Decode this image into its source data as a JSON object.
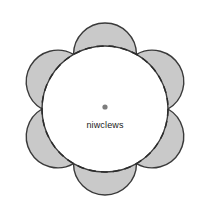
{
  "figure": {
    "title": "niwclews",
    "background_color": "#ffffff",
    "center_label": {
      "text": "niwclews",
      "color": "#1a1a1a",
      "font_size_px": 9,
      "x": 105,
      "y": 120
    },
    "center_dot": {
      "name": "center-point-marker",
      "x": 105,
      "y": 107,
      "radius": 2.6,
      "color": "#7d7d7d"
    },
    "dashed_circle": {
      "name": "dashed-construction-circle",
      "cx": 105,
      "cy": 109,
      "r": 63,
      "stroke": "#2b2b2b",
      "stroke_width": 1.5,
      "dash_pattern": "7 5",
      "fill": "none"
    },
    "petals": {
      "count": 6,
      "fill": "#c9c9c9",
      "stroke": "#3a3a3a",
      "stroke_width": 1.4,
      "outer_bulge": 30,
      "inner_bulge": 63,
      "vertex_angles_deg": [
        30,
        90,
        150,
        210,
        270,
        330
      ],
      "items": [
        {
          "label": "petal-top",
          "angle_deg": 0
        },
        {
          "label": "petal-upper-right",
          "angle_deg": 60
        },
        {
          "label": "petal-lower-right",
          "angle_deg": 120
        },
        {
          "label": "petal-bottom",
          "angle_deg": 180
        },
        {
          "label": "petal-lower-left",
          "angle_deg": 240
        },
        {
          "label": "petal-upper-left",
          "angle_deg": 300
        }
      ]
    },
    "inner_region": {
      "name": "inner-hexagon-region",
      "fill": "#ffffff"
    },
    "colors": {
      "petal_fill": "#c9c9c9",
      "outline": "#3a3a3a",
      "dashed_stroke": "#2b2b2b",
      "dot": "#7d7d7d",
      "label_text": "#1a1a1a",
      "background": "#ffffff"
    }
  }
}
